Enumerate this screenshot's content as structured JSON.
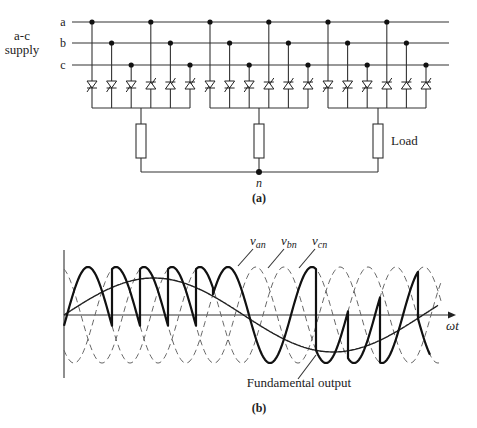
{
  "figure_a": {
    "supply_label_line1": "a-c",
    "supply_label_line2": "supply",
    "phase_labels": [
      "a",
      "b",
      "c"
    ],
    "load_label": "Load",
    "neutral_label": "n",
    "caption": "(a)",
    "groups": 3,
    "thyristors_per_group": 6,
    "thyristor_orientation": [
      "down",
      "down",
      "down",
      "up",
      "up",
      "up"
    ]
  },
  "figure_b": {
    "caption": "(b)",
    "x_axis_label": "ωt",
    "curve_labels": [
      {
        "base": "v",
        "sub": "an"
      },
      {
        "base": "v",
        "sub": "bn"
      },
      {
        "base": "v",
        "sub": "cn"
      }
    ],
    "fundamental_label": "Fundamental output",
    "dashed_series": [
      "v_an",
      "v_bn",
      "v_cn"
    ],
    "thick_series": "cycloconverter output",
    "smooth_series": "fundamental output"
  },
  "colors": {
    "ink": "#222222",
    "dashed": "#666666",
    "background": "#ffffff"
  }
}
